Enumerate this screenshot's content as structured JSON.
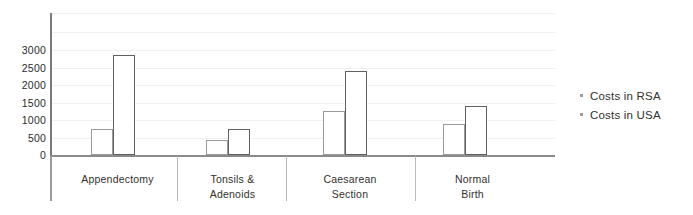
{
  "chart_data": {
    "type": "bar",
    "title": "",
    "subtitle": "",
    "xlabel": "",
    "ylabel": "",
    "categories": [
      "Appendectomy",
      "Tonsils & Adenoids",
      "Caesarean Section",
      "Normal Birth"
    ],
    "category_lines": [
      [
        "Appendectomy"
      ],
      [
        "Tonsils &",
        "Adenoids"
      ],
      [
        "Caesarean",
        "Section"
      ],
      [
        "Normal",
        "Birth"
      ]
    ],
    "series": [
      {
        "name": "Costs in RSA",
        "values": [
          730,
          420,
          1270,
          880
        ]
      },
      {
        "name": "Costs in USA",
        "values": [
          2850,
          730,
          2400,
          1400
        ]
      }
    ],
    "ylim": [
      0,
      4000
    ],
    "ytick_labels": [
      "0",
      "500",
      "1000",
      "1500",
      "2000",
      "2500",
      "3000"
    ],
    "ytick_values": [
      0,
      500,
      1000,
      1500,
      2000,
      2500,
      3000
    ],
    "grid": true,
    "legend_position": "right",
    "colors": {
      "series_rsa_outline": "#9a9a9a",
      "series_usa_outline": "#616161",
      "bar_fill": "#ffffff",
      "gridline": "#f0f0f0",
      "axis": "#8a8a8a",
      "text": "#33302e"
    }
  },
  "legend": {
    "items": [
      {
        "label": "Costs in RSA"
      },
      {
        "label": "Costs in USA"
      }
    ]
  },
  "axis": {
    "y_ticks": [
      "3000",
      "2500",
      "2000",
      "1500",
      "1000",
      "500",
      "0"
    ]
  }
}
